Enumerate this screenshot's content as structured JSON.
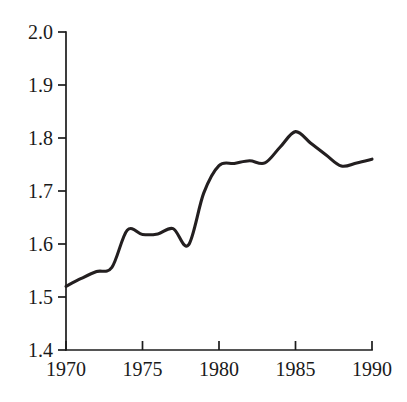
{
  "chart_data": {
    "type": "line",
    "title": "",
    "subtitle": "",
    "xlabel": "",
    "ylabel": "",
    "xlim": [
      1970,
      1990
    ],
    "ylim": [
      1.4,
      2.0
    ],
    "grid": false,
    "legend": null,
    "annotations": [],
    "x_ticks": [
      1970,
      1975,
      1980,
      1985,
      1990
    ],
    "x_tick_labels": [
      "1970",
      "1975",
      "1980",
      "1985",
      "1990"
    ],
    "y_ticks": [
      1.4,
      1.5,
      1.6,
      1.7,
      1.8,
      1.9,
      2.0
    ],
    "y_tick_labels": [
      "1.4",
      "1.5",
      "1.6",
      "1.7",
      "1.8",
      "1.9",
      "2.0"
    ],
    "line_color": "#231f20",
    "background_color": "#ffffff",
    "axis_color": "#1c1c1c",
    "x": [
      1970,
      1971,
      1972,
      1973,
      1974,
      1975,
      1976,
      1977,
      1978,
      1979,
      1980,
      1981,
      1982,
      1983,
      1984,
      1985,
      1986,
      1987,
      1988,
      1989,
      1990
    ],
    "values": [
      1.52,
      1.535,
      1.548,
      1.556,
      1.626,
      1.618,
      1.619,
      1.629,
      1.598,
      1.696,
      1.748,
      1.752,
      1.757,
      1.753,
      1.783,
      1.812,
      1.79,
      1.768,
      1.747,
      1.753,
      1.76
    ],
    "series": [
      {
        "name": "series-1",
        "color": "#231f20",
        "values": [
          1.52,
          1.535,
          1.548,
          1.556,
          1.626,
          1.618,
          1.619,
          1.629,
          1.598,
          1.696,
          1.748,
          1.752,
          1.757,
          1.753,
          1.783,
          1.812,
          1.79,
          1.768,
          1.747,
          1.753,
          1.76
        ]
      }
    ]
  },
  "axes": {
    "y_labels": [
      "2.0",
      "1.9",
      "1.8",
      "1.7",
      "1.6",
      "1.5",
      "1.4"
    ],
    "x_labels": [
      "1970",
      "1975",
      "1980",
      "1985",
      "1990"
    ]
  }
}
